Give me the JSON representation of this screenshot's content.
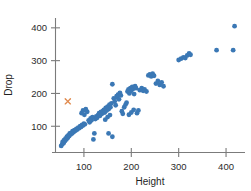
{
  "chart_data": {
    "type": "scatter",
    "title": "",
    "xlabel": "Height",
    "ylabel": "Drop",
    "xlim": [
      40,
      440
    ],
    "ylim": [
      20,
      430
    ],
    "xticks": [
      100,
      200,
      300,
      400
    ],
    "yticks": [
      100,
      200,
      300,
      400
    ],
    "xtick_labels": [
      "100",
      "200",
      "300",
      "400"
    ],
    "ytick_labels": [
      "100",
      "200",
      "300",
      "400"
    ],
    "grid": false,
    "legend": "none",
    "series": [
      {
        "name": "observations",
        "marker": "circle",
        "color": "#3B78B5",
        "points": [
          [
            52,
            40
          ],
          [
            54,
            45
          ],
          [
            55,
            52
          ],
          [
            57,
            48
          ],
          [
            58,
            58
          ],
          [
            60,
            55
          ],
          [
            61,
            62
          ],
          [
            63,
            60
          ],
          [
            64,
            68
          ],
          [
            66,
            65
          ],
          [
            67,
            72
          ],
          [
            69,
            70
          ],
          [
            70,
            78
          ],
          [
            72,
            75
          ],
          [
            73,
            80
          ],
          [
            75,
            78
          ],
          [
            76,
            85
          ],
          [
            78,
            82
          ],
          [
            80,
            88
          ],
          [
            82,
            86
          ],
          [
            84,
            92
          ],
          [
            86,
            90
          ],
          [
            88,
            96
          ],
          [
            90,
            94
          ],
          [
            92,
            100
          ],
          [
            94,
            98
          ],
          [
            96,
            104
          ],
          [
            98,
            102
          ],
          [
            100,
            108
          ],
          [
            102,
            106
          ],
          [
            95,
            140
          ],
          [
            98,
            148
          ],
          [
            101,
            135
          ],
          [
            104,
            152
          ],
          [
            107,
            144
          ],
          [
            110,
            118
          ],
          [
            112,
            112
          ],
          [
            114,
            124
          ],
          [
            116,
            118
          ],
          [
            118,
            128
          ],
          [
            120,
            60
          ],
          [
            122,
            78
          ],
          [
            124,
            122
          ],
          [
            126,
            130
          ],
          [
            128,
            126
          ],
          [
            130,
            134
          ],
          [
            132,
            140
          ],
          [
            134,
            132
          ],
          [
            136,
            144
          ],
          [
            138,
            138
          ],
          [
            140,
            146
          ],
          [
            142,
            150
          ],
          [
            144,
            142
          ],
          [
            146,
            156
          ],
          [
            148,
            148
          ],
          [
            150,
            160
          ],
          [
            152,
            152
          ],
          [
            154,
            166
          ],
          [
            156,
            158
          ],
          [
            158,
            170
          ],
          [
            160,
            228
          ],
          [
            163,
            185
          ],
          [
            165,
            176
          ],
          [
            167,
            164
          ],
          [
            169,
            192
          ],
          [
            152,
            78
          ],
          [
            160,
            68
          ],
          [
            145,
            120
          ],
          [
            150,
            128
          ],
          [
            155,
            134
          ],
          [
            170,
            188
          ],
          [
            172,
            196
          ],
          [
            174,
            182
          ],
          [
            176,
            202
          ],
          [
            178,
            194
          ],
          [
            180,
            146
          ],
          [
            182,
            138
          ],
          [
            185,
            158
          ],
          [
            188,
            166
          ],
          [
            190,
            172
          ],
          [
            192,
            206
          ],
          [
            194,
            212
          ],
          [
            196,
            200
          ],
          [
            198,
            216
          ],
          [
            200,
            208
          ],
          [
            202,
            220
          ],
          [
            204,
            214
          ],
          [
            206,
            198
          ],
          [
            208,
            222
          ],
          [
            210,
            216
          ],
          [
            195,
            135
          ],
          [
            200,
            142
          ],
          [
            205,
            150
          ],
          [
            212,
            140
          ],
          [
            215,
            148
          ],
          [
            218,
            210
          ],
          [
            222,
            216
          ],
          [
            225,
            208
          ],
          [
            228,
            212
          ],
          [
            232,
            206
          ],
          [
            236,
            255
          ],
          [
            239,
            258
          ],
          [
            242,
            252
          ],
          [
            245,
            260
          ],
          [
            248,
            254
          ],
          [
            252,
            230
          ],
          [
            256,
            238
          ],
          [
            260,
            226
          ],
          [
            264,
            234
          ],
          [
            268,
            222
          ],
          [
            300,
            302
          ],
          [
            305,
            306
          ],
          [
            310,
            310
          ],
          [
            314,
            308
          ],
          [
            318,
            316
          ],
          [
            322,
            322
          ],
          [
            325,
            318
          ],
          [
            380,
            332
          ],
          [
            415,
            332
          ],
          [
            418,
            405
          ]
        ]
      },
      {
        "name": "highlighted-observation",
        "marker": "x",
        "color": "#E08B4F",
        "points": [
          [
            66,
            176
          ]
        ]
      }
    ]
  },
  "axes": {
    "x_title": "Height",
    "y_title": "Drop",
    "x_tick_labels": [
      "100",
      "200",
      "300",
      "400"
    ],
    "y_tick_labels": [
      "100",
      "200",
      "300",
      "400"
    ]
  },
  "colors": {
    "point_blue": "#3B78B5",
    "marker_orange": "#E08B4F",
    "axis_gray": "#7b7b7b",
    "text": "#2b2b2b",
    "background": "#ffffff"
  }
}
